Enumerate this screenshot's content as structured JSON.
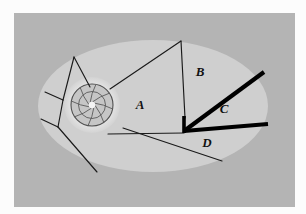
{
  "figure": {
    "background_color": "#fcfcfc",
    "panel_color": "#b4b4b4",
    "ellipse_fill": "#cfcfcf",
    "halo_color": "#e8e8e8",
    "disk_fill": "#c6c6c6",
    "thin_line_color": "#1a1a1a",
    "thick_line_color": "#000000",
    "web_line_color": "#5a5a5a",
    "core_color": "#f2f2f2"
  },
  "panel": {
    "x": 14,
    "y": 13,
    "width": 281,
    "height": 194
  },
  "ellipse": {
    "cx": 153,
    "cy": 106,
    "rx": 115,
    "ry": 66
  },
  "center_disk": {
    "cx": 92,
    "cy": 105,
    "halo_r": 28,
    "disk_r": 21,
    "core_r": 3.2,
    "web_rings": [
      7,
      13.5
    ],
    "spoke_count": 8
  },
  "labels": [
    {
      "id": "label-a",
      "text": "A",
      "x": 140,
      "y": 109
    },
    {
      "id": "label-b",
      "text": "B",
      "x": 200,
      "y": 76
    },
    {
      "id": "label-c",
      "text": "C",
      "x": 224,
      "y": 113
    },
    {
      "id": "label-d",
      "text": "D",
      "x": 207,
      "y": 147
    }
  ],
  "thick_edges": [
    {
      "id": "edge-b-c",
      "x1": 184,
      "y1": 131,
      "x2": 264,
      "y2": 72,
      "width": 4.2
    },
    {
      "id": "edge-c-d",
      "x1": 184,
      "y1": 131,
      "x2": 268,
      "y2": 124,
      "width": 4.2
    },
    {
      "id": "edge-vertex-stub",
      "x1": 184,
      "y1": 116,
      "x2": 184,
      "y2": 133,
      "width": 3.6
    }
  ],
  "thin_edges": [
    {
      "id": "edge-a-top",
      "x1": 181,
      "y1": 41,
      "x2": 110,
      "y2": 89
    },
    {
      "id": "edge-a-right",
      "x1": 181,
      "y1": 41,
      "x2": 185,
      "y2": 118
    },
    {
      "id": "edge-a-bottom",
      "x1": 108,
      "y1": 134,
      "x2": 184,
      "y2": 133
    },
    {
      "id": "edge-d-lower",
      "x1": 123,
      "y1": 128,
      "x2": 222,
      "y2": 161
    },
    {
      "id": "edge-left-upper",
      "x1": 90,
      "y1": 87,
      "x2": 74,
      "y2": 57
    },
    {
      "id": "edge-left-upper2",
      "x1": 74,
      "y1": 57,
      "x2": 63,
      "y2": 100
    },
    {
      "id": "edge-left-mid",
      "x1": 63,
      "y1": 100,
      "x2": 45,
      "y2": 92
    },
    {
      "id": "edge-left-lower",
      "x1": 63,
      "y1": 100,
      "x2": 58,
      "y2": 127
    },
    {
      "id": "edge-left-lower2",
      "x1": 58,
      "y1": 127,
      "x2": 41,
      "y2": 119
    },
    {
      "id": "edge-left-bottom",
      "x1": 58,
      "y1": 127,
      "x2": 97,
      "y2": 172
    }
  ],
  "web_spokes": [
    {
      "id": "spoke-0",
      "angle": 10
    },
    {
      "id": "spoke-1",
      "angle": 55
    },
    {
      "id": "spoke-2",
      "angle": 100
    },
    {
      "id": "spoke-3",
      "angle": 145
    },
    {
      "id": "spoke-4",
      "angle": 190
    },
    {
      "id": "spoke-5",
      "angle": 235
    },
    {
      "id": "spoke-6",
      "angle": 280
    },
    {
      "id": "spoke-7",
      "angle": 325
    }
  ]
}
